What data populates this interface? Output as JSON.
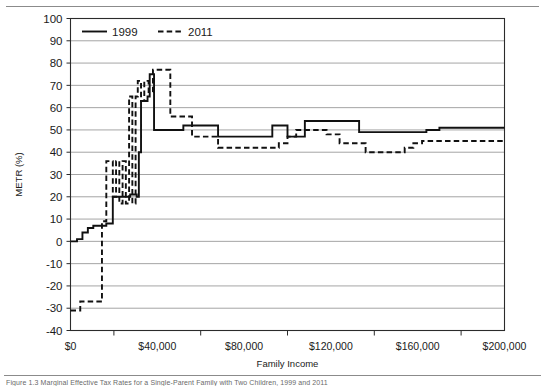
{
  "figure": {
    "caption": "Figure 1.3    Marginal Effective Tax Rates for a Single-Parent Family with Two Children, 1999 and 2011"
  },
  "chart_data": {
    "type": "line",
    "title": "",
    "subtitle": "",
    "xlabel": "Family Income",
    "ylabel": "METR (%)",
    "xlim": [
      0,
      200000
    ],
    "ylim": [
      -40,
      100
    ],
    "ytick_step": 10,
    "xtick_step": 20000,
    "xtick_labels": [
      "$0",
      "$40,000",
      "$80,000",
      "$120,000",
      "$160,000",
      "$200,000"
    ],
    "xtick_label_values": [
      0,
      40000,
      80000,
      120000,
      160000,
      200000
    ],
    "xminor_tick_values": [
      20000,
      60000,
      100000,
      140000,
      180000
    ],
    "ytick_labels": [
      "100",
      "90",
      "80",
      "70",
      "60",
      "50",
      "40",
      "30",
      "20",
      "10",
      "0",
      "-10",
      "-20",
      "-30",
      "-40"
    ],
    "ytick_values": [
      100,
      90,
      80,
      70,
      60,
      50,
      40,
      30,
      20,
      10,
      0,
      -10,
      -20,
      -30,
      -40
    ],
    "grid": "horizontal",
    "legend_position": "top-left-inside",
    "legend": [
      {
        "name": "1999",
        "style": "solid"
      },
      {
        "name": "2011",
        "style": "dashed"
      }
    ],
    "series": [
      {
        "name": "1999",
        "style": "solid",
        "step": "post",
        "x": [
          0,
          3000,
          5500,
          8000,
          10500,
          13000,
          16500,
          19500,
          22500,
          25500,
          27500,
          29500,
          30500,
          31500,
          32500,
          33500,
          35500,
          36500,
          38500,
          52000,
          57000,
          62000,
          68000,
          72000,
          78000,
          84000,
          88000,
          93000,
          96000,
          100000,
          103000,
          108000,
          113000,
          119000,
          123000,
          128000,
          133000,
          139000,
          146000,
          152000,
          158000,
          164000,
          170000,
          200000
        ],
        "y": [
          0,
          1,
          4,
          6,
          7,
          7,
          8,
          20,
          20,
          20,
          21,
          21,
          20,
          40,
          63,
          63,
          65,
          75,
          50,
          52,
          52,
          52,
          47,
          47,
          47,
          47,
          47,
          52,
          52,
          47,
          47,
          54,
          54,
          54,
          54,
          54,
          49,
          49,
          49,
          49,
          49,
          50,
          51,
          51
        ]
      },
      {
        "name": "2011",
        "style": "dashed",
        "step": "post",
        "x": [
          0,
          2000,
          4500,
          7000,
          9500,
          12000,
          14500,
          16500,
          18000,
          19500,
          21000,
          22500,
          24000,
          25500,
          27000,
          28500,
          30000,
          31000,
          32500,
          34000,
          36000,
          38000,
          40000,
          43000,
          46000,
          50000,
          56000,
          60000,
          64000,
          68000,
          74000,
          80000,
          86000,
          92000,
          96000,
          100000,
          104000,
          108000,
          112000,
          118000,
          124000,
          130000,
          136000,
          142000,
          148000,
          154000,
          158000,
          162000,
          166000,
          172000,
          200000
        ],
        "y": [
          -31,
          -31,
          -27,
          -27,
          -27,
          -27,
          9,
          36,
          36,
          20,
          36,
          17,
          36,
          17,
          65,
          17,
          65,
          72,
          63,
          72,
          67,
          77,
          77,
          77,
          56,
          56,
          47,
          47,
          47,
          42,
          42,
          42,
          42,
          42,
          44,
          47,
          50,
          50,
          50,
          48,
          44,
          44,
          40,
          40,
          40,
          42,
          44,
          45,
          45,
          45,
          45
        ]
      }
    ]
  }
}
